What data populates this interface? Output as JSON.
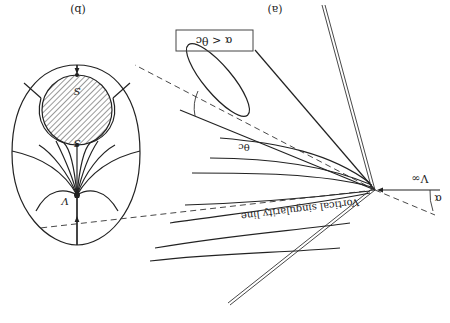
{
  "figure": {
    "orientation": "rotated 180 degrees",
    "panel_a": {
      "label": "(a)",
      "condition_box": "α < θc",
      "freestream_label": "V∞",
      "angle_of_attack_label": "α",
      "cone_half_angle_label": "θc",
      "singularity_label": "Vortical singularity line"
    },
    "panel_b": {
      "label": "(b)",
      "node_label": "V",
      "saddle_top_label": "S",
      "saddle_bottom_label": "S"
    },
    "colors": {
      "ink": "#222222",
      "background": "#ffffff",
      "hatch": "#555555"
    }
  }
}
